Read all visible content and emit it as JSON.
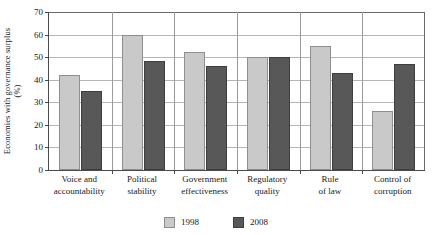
{
  "chart_data": {
    "type": "bar",
    "title": "",
    "xlabel": "",
    "ylabel": "Economies with governance surplus (%)",
    "ylabel_line1": "Economies with governance surplus",
    "ylabel_line2": "(%)",
    "ylim": [
      0,
      70
    ],
    "ytick_step": 10,
    "yticks": [
      0,
      10,
      20,
      30,
      40,
      50,
      60,
      70
    ],
    "ytick_labels": [
      "0",
      "10",
      "20",
      "30",
      "40",
      "50",
      "60",
      "70"
    ],
    "grid": true,
    "legend_position": "bottom",
    "categories": [
      "Voice and accountability",
      "Political stability",
      "Government effectiveness",
      "Regulatory quality",
      "Rule of law",
      "Control of corruption"
    ],
    "category_lines": [
      [
        "Voice and",
        "accountability"
      ],
      [
        "Political",
        "stability"
      ],
      [
        "Government",
        "effectiveness"
      ],
      [
        "Regulatory",
        "quality"
      ],
      [
        "Rule",
        "of law"
      ],
      [
        "Control of",
        "corruption"
      ]
    ],
    "series": [
      {
        "name": "1998",
        "color": "#c9c9c9",
        "values": [
          42,
          60,
          52.5,
          50,
          55,
          26
        ]
      },
      {
        "name": "2008",
        "color": "#585858",
        "values": [
          35,
          48.5,
          46,
          50,
          43,
          47
        ]
      }
    ]
  },
  "legend": {
    "items": [
      {
        "label": "1998",
        "color": "#c9c9c9"
      },
      {
        "label": "2008",
        "color": "#585858"
      }
    ]
  },
  "colors": {
    "series_1998": "#c9c9c9",
    "series_2008": "#585858",
    "axis": "#4a4a4a",
    "gridline": "#b6b6b6",
    "background": "#ffffff"
  }
}
